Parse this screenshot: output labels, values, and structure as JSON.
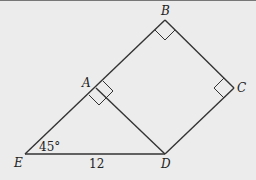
{
  "diagram": {
    "type": "geometry",
    "points": {
      "A": {
        "label": "A"
      },
      "B": {
        "label": "B"
      },
      "C": {
        "label": "C"
      },
      "D": {
        "label": "D"
      },
      "E": {
        "label": "E"
      }
    },
    "segments": [
      "EB",
      "ED",
      "AD",
      "BC",
      "CD"
    ],
    "right_angles": [
      "EAD",
      "BAD",
      "ABC",
      "BCD"
    ],
    "annotations": {
      "angle_E": "45°",
      "length_ED": "12"
    }
  }
}
